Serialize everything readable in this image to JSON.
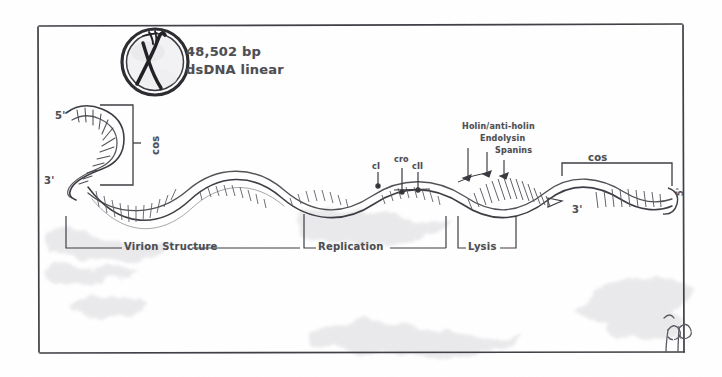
{
  "figure": {
    "title_lines": [
      "48,502 bp",
      "dsDNA linear"
    ],
    "icon": {
      "name": "lambda-phage-circle-icon",
      "glyph": "λ"
    },
    "paper_color": "#ffffff",
    "ink_color": "#4a4a4f",
    "pencil_color": "#6e6e78"
  },
  "ends": {
    "left_five_prime": "5'",
    "left_three_prime": "3'",
    "right_three_prime": "3'",
    "right_five_prime": "5'"
  },
  "cos_sites": {
    "left_label": "cos",
    "right_label": "cos"
  },
  "genes": {
    "regulatory": [
      {
        "name": "cI",
        "label": "cI"
      },
      {
        "name": "cro",
        "label": "cro"
      },
      {
        "name": "cII",
        "label": "cII"
      }
    ],
    "lysis": [
      {
        "name": "holin-anti-holin",
        "label": "Holin/anti-holin"
      },
      {
        "name": "endolysin",
        "label": "Endolysin"
      },
      {
        "name": "spanins",
        "label": "Spanins"
      }
    ]
  },
  "regions": [
    {
      "name": "virion-structure",
      "label": "Virion Structure"
    },
    {
      "name": "replication",
      "label": "Replication"
    },
    {
      "name": "lysis",
      "label": "Lysis"
    }
  ],
  "signature": {
    "label": "JP"
  }
}
